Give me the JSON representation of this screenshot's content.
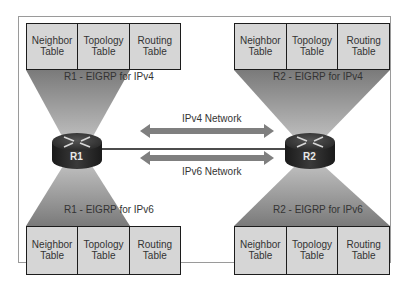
{
  "diagram": {
    "colors": {
      "cone": "#8c8c8c",
      "table_fill": "#d6d6d6",
      "router_body": "#2b2b2b",
      "arrow": "#7f7f7f"
    },
    "routers": [
      {
        "name": "R1",
        "icon": "router-icon",
        "ipv4": {
          "label": "R1 - EIGRP for IPv4",
          "tables": [
            "Neighbor\nTable",
            "Topology\nTable",
            "Routing\nTable"
          ]
        },
        "ipv6": {
          "label": "R1 - EIGRP for IPv6",
          "tables": [
            "Neighbor\nTable",
            "Topology\nTable",
            "Routing\nTable"
          ]
        }
      },
      {
        "name": "R2",
        "icon": "router-icon",
        "ipv4": {
          "label": "R2 - EIGRP for IPv4",
          "tables": [
            "Neighbor\nTable",
            "Topology\nTable",
            "Routing\nTable"
          ]
        },
        "ipv6": {
          "label": "R2 - EIGRP for IPv6",
          "tables": [
            "Neighbor\nTable",
            "Topology\nTable",
            "Routing\nTable"
          ]
        }
      }
    ],
    "links": {
      "ipv4_label": "IPv4 Network",
      "ipv6_label": "IPv6 Network"
    }
  }
}
